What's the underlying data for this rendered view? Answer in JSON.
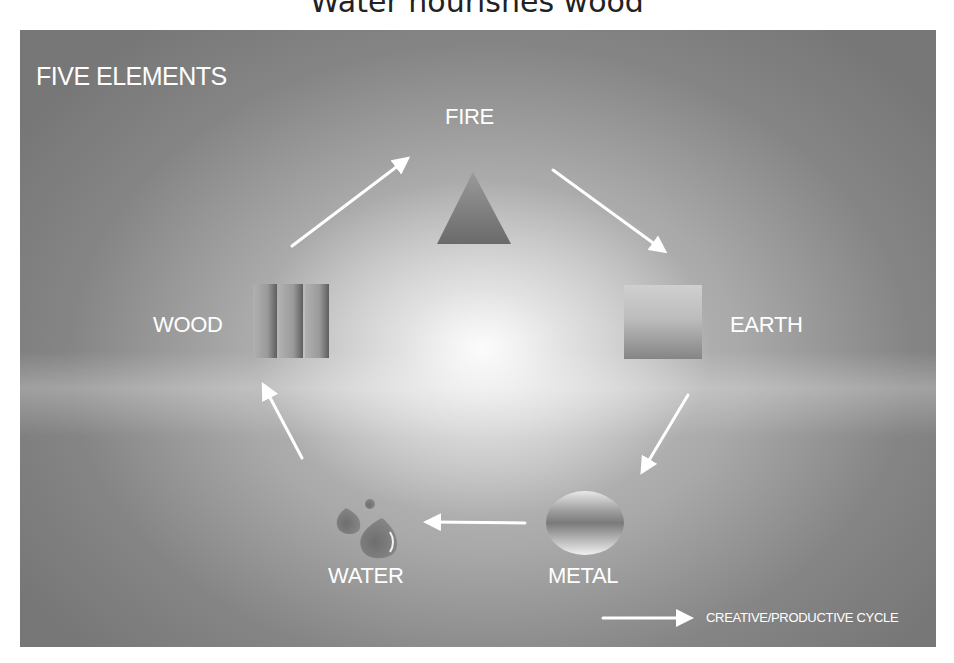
{
  "caption": "Water nourishes wood",
  "diagram": {
    "title": "FIVE ELEMENTS",
    "elements": [
      {
        "name": "FIRE",
        "shape": "triangle-icon"
      },
      {
        "name": "EARTH",
        "shape": "square-icon"
      },
      {
        "name": "METAL",
        "shape": "circle-icon"
      },
      {
        "name": "WATER",
        "shape": "droplets-icon"
      },
      {
        "name": "WOOD",
        "shape": "vertical-bars-icon"
      }
    ],
    "cycle_order": [
      "FIRE",
      "EARTH",
      "METAL",
      "WATER",
      "WOOD",
      "FIRE"
    ],
    "legend": {
      "label": "CREATIVE/PRODUCTIVE CYCLE",
      "icon": "arrow-right-icon"
    },
    "colors": {
      "text": "#ffffff",
      "background": "#9a9a9a",
      "shapes": "#8a8a8a"
    }
  }
}
